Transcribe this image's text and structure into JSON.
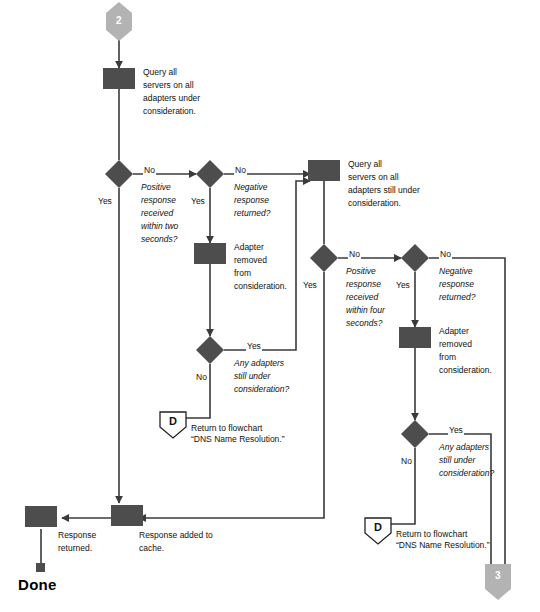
{
  "diagram": {
    "colors": {
      "process_fill": "#4d4d4d",
      "decision_fill": "#4d4d4d",
      "connector_fill": "#b3b3b3",
      "line": "#3a3a3a",
      "text": "#111111",
      "background": "#ffffff"
    },
    "connectors": [
      {
        "id": "in-2",
        "label": "2",
        "shape": "pentagon-down-point",
        "position": "top-left-column"
      },
      {
        "id": "out-3",
        "label": "3",
        "shape": "pentagon-down-point",
        "position": "bottom-right"
      }
    ],
    "offpage": [
      {
        "id": "offpage-D-left",
        "label": "D",
        "caption_line1": "Return to flowchart",
        "caption_line2": "“DNS Name Resolution.”"
      },
      {
        "id": "offpage-D-right",
        "label": "D",
        "caption_line1": "Return to flowchart",
        "caption_line2": "“DNS Name Resolution.”"
      }
    ],
    "processes": [
      {
        "id": "query-all-1",
        "line1": "Query all",
        "line2": "servers on all",
        "line3": "adapters under",
        "line4": "consideration."
      },
      {
        "id": "adapter-removed-1",
        "line1": "Adapter",
        "line2": "removed",
        "line3": "from",
        "line4": "consideration."
      },
      {
        "id": "query-all-2",
        "line1": "Query all",
        "line2": "servers on all",
        "line3": "adapters still under",
        "line4": "consideration."
      },
      {
        "id": "adapter-removed-2",
        "line1": "Adapter",
        "line2": "removed",
        "line3": "from",
        "line4": "consideration."
      },
      {
        "id": "response-added-cache",
        "line1": "Response added to",
        "line2": "cache."
      },
      {
        "id": "response-returned",
        "line1": "Response",
        "line2": "returned."
      }
    ],
    "decisions": [
      {
        "id": "positive-two-sec",
        "line1": "Positive",
        "line2": "response",
        "line3": "received",
        "line4": "within two",
        "line5": "seconds?",
        "yes": "Yes",
        "no": "No"
      },
      {
        "id": "negative-returned-1",
        "line1": "Negative",
        "line2": "response",
        "line3": "returned?",
        "yes": "Yes",
        "no": "No"
      },
      {
        "id": "any-adapters-1",
        "line1": "Any adapters",
        "line2": "still under",
        "line3": "consideration?",
        "yes": "Yes",
        "no": "No"
      },
      {
        "id": "positive-four-sec",
        "line1": "Positive",
        "line2": "response",
        "line3": "received",
        "line4": "within four",
        "line5": "seconds?",
        "yes": "Yes",
        "no": "No"
      },
      {
        "id": "negative-returned-2",
        "line1": "Negative",
        "line2": "response",
        "line3": "returned?",
        "yes": "Yes",
        "no": "No"
      },
      {
        "id": "any-adapters-2",
        "line1": "Any adapters",
        "line2": "still under",
        "line3": "consideration?",
        "yes": "Yes",
        "no": "No"
      }
    ],
    "terminator": {
      "id": "done",
      "label": "Done"
    }
  }
}
